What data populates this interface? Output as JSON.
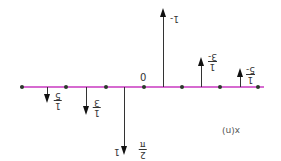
{
  "figure": {
    "title_label": "x(n)",
    "origin_label": "0",
    "axis_color": "#d66ad0",
    "note": "labels are rendered rotated 180 degrees in the source image"
  },
  "stems": [
    {
      "n": -3,
      "value": -0.2,
      "label_num": "1",
      "label_den": "5",
      "label_sign": "-"
    },
    {
      "n": -2,
      "value": -0.333,
      "label_num": "1",
      "label_den": "3",
      "label_sign": "-"
    },
    {
      "n": -1,
      "value": -1,
      "label_num": "",
      "label_den": "",
      "label_sign": "-1",
      "extra_num": "2",
      "extra_den": "π"
    },
    {
      "n": 0.5,
      "value": 1,
      "label_sign": "1"
    },
    {
      "n": 1.5,
      "value": 0.333,
      "label_num": "1",
      "label_den": "3"
    },
    {
      "n": 2.5,
      "value": 0.2,
      "label_num": "1",
      "label_den": "5"
    }
  ],
  "labels": {
    "neg_fifth": {
      "num": "1",
      "den": "5"
    },
    "neg_third": {
      "num": "1",
      "den": "3"
    },
    "neg_one": "1",
    "two_over_pi": {
      "num": "2",
      "den": "π"
    },
    "pos_one": "1-",
    "pos_third": {
      "num": "1",
      "den": "3-"
    },
    "pos_fifth": {
      "num": "1",
      "den": "5-"
    }
  }
}
